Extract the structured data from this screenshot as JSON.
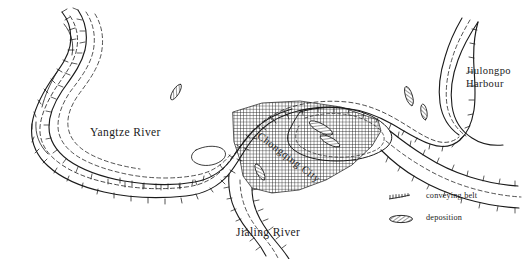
{
  "map": {
    "title": "Chongqing river confluence sketch map",
    "background_color": "#ffffff",
    "ink_color": "#1a1a1a",
    "labels": {
      "yangtze": "Yangtze River",
      "jialing": "Jialing River",
      "jiulongpo_line1": "Jiulongpo",
      "jiulongpo_line2": "Harbour",
      "chongqing": "Chongqing City"
    }
  },
  "legend": {
    "items": [
      {
        "symbol": "conveying-belt-symbol",
        "label": "conveying belt"
      },
      {
        "symbol": "deposition-symbol",
        "label": "deposition"
      }
    ]
  }
}
